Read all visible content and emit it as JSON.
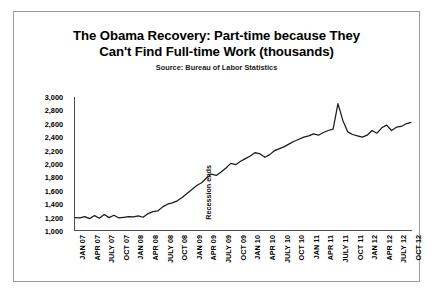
{
  "chart_data": {
    "type": "line",
    "title": "The Obama Recovery: Part-time because They Can't Find Full-time Work (thousands)",
    "title_lines": [
      "The Obama Recovery: Part-time because They",
      "Can't Find Full-time Work (thousands)"
    ],
    "subtitle": "Source: Bureau of Labor Statistics",
    "xlabel": "",
    "ylabel": "",
    "ylim": [
      1000,
      3000
    ],
    "y_ticks": [
      "3,000",
      "2,800",
      "2,600",
      "2,400",
      "2,200",
      "2,000",
      "1,800",
      "1,600",
      "1,400",
      "1,200",
      "1,000"
    ],
    "y_tick_values": [
      3000,
      2800,
      2600,
      2400,
      2200,
      2000,
      1800,
      1600,
      1400,
      1200,
      1000
    ],
    "grid": false,
    "legend": "none",
    "x_tick_labels": [
      "JAN 07",
      "APR 07",
      "JULY 07",
      "OCT 07",
      "JAN 08",
      "APR 08",
      "JULY 08",
      "OCT 08",
      "JAN 09",
      "APR 09",
      "JULY 09",
      "OCT 09",
      "JAN 10",
      "APR 10",
      "JULY 10",
      "OCT 10",
      "JAN 11",
      "APR 11",
      "JULY 11",
      "OCT 11",
      "JAN 12",
      "APR 12",
      "JULY 12",
      "OCT 12"
    ],
    "annotations": [
      {
        "text": "Recession ends",
        "x_label": "JUNE 09",
        "orientation": "vertical"
      }
    ],
    "line_color": "#1a1a1a",
    "x": [
      "JAN 07",
      "FEB 07",
      "MAR 07",
      "APR 07",
      "MAY 07",
      "JUNE 07",
      "JULY 07",
      "AUG 07",
      "SEP 07",
      "OCT 07",
      "NOV 07",
      "DEC 07",
      "JAN 08",
      "FEB 08",
      "MAR 08",
      "APR 08",
      "MAY 08",
      "JUNE 08",
      "JULY 08",
      "AUG 08",
      "SEP 08",
      "OCT 08",
      "NOV 08",
      "DEC 08",
      "JAN 09",
      "FEB 09",
      "MAR 09",
      "APR 09",
      "MAY 09",
      "JUNE 09",
      "JULY 09",
      "AUG 09",
      "SEP 09",
      "OCT 09",
      "NOV 09",
      "DEC 09",
      "JAN 10",
      "FEB 10",
      "MAR 10",
      "APR 10",
      "MAY 10",
      "JUNE 10",
      "JULY 10",
      "AUG 10",
      "SEP 10",
      "OCT 10",
      "NOV 10",
      "DEC 10",
      "JAN 11",
      "FEB 11",
      "MAR 11",
      "APR 11",
      "MAY 11",
      "JUNE 11",
      "JULY 11",
      "AUG 11",
      "SEP 11",
      "OCT 11",
      "NOV 11",
      "DEC 11",
      "JAN 12",
      "FEB 12",
      "MAR 12",
      "APR 12",
      "MAY 12",
      "JUNE 12",
      "JULY 12",
      "AUG 12",
      "SEP 12",
      "OCT 12"
    ],
    "values": [
      1200,
      1195,
      1215,
      1185,
      1230,
      1190,
      1245,
      1200,
      1235,
      1195,
      1205,
      1215,
      1210,
      1225,
      1205,
      1260,
      1290,
      1300,
      1360,
      1400,
      1420,
      1450,
      1500,
      1560,
      1620,
      1680,
      1720,
      1790,
      1850,
      1830,
      1880,
      1940,
      2010,
      1990,
      2040,
      2080,
      2120,
      2170,
      2150,
      2100,
      2140,
      2200,
      2230,
      2260,
      2300,
      2340,
      2370,
      2400,
      2420,
      2450,
      2430,
      2470,
      2500,
      2520,
      2900,
      2650,
      2480,
      2440,
      2420,
      2400,
      2430,
      2500,
      2460,
      2540,
      2580,
      2500,
      2550,
      2560,
      2600,
      2620
    ]
  }
}
